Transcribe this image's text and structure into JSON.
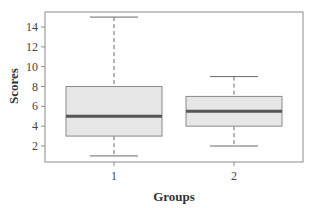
{
  "chart_data": {
    "type": "box",
    "title": "",
    "xlabel": "Groups",
    "ylabel": "Scores",
    "categories": [
      "1",
      "2"
    ],
    "ylim": [
      0.5,
      15.5
    ],
    "yticks": [
      2,
      4,
      6,
      8,
      10,
      12,
      14
    ],
    "grid": false,
    "legend": null,
    "boxes": [
      {
        "group": "1",
        "min": 1,
        "q1": 3,
        "median": 5,
        "q3": 8,
        "max": 15
      },
      {
        "group": "2",
        "min": 2,
        "q1": 4,
        "median": 5.5,
        "q3": 7,
        "max": 9
      }
    ],
    "colors": {
      "box_fill": "#e6e6e6",
      "box_border": "#8a8a8a",
      "median": "#555555",
      "whisker": "#6a6a6a",
      "frame": "#8a8a8a"
    }
  }
}
